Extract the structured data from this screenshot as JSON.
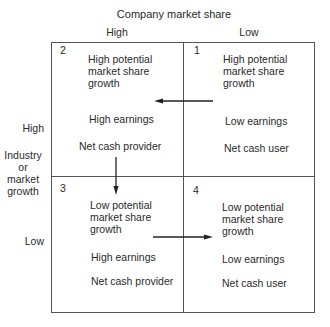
{
  "title": "Company market share",
  "columns": [
    {
      "label": "High"
    },
    {
      "label": "Low"
    }
  ],
  "rows": {
    "axis_label_lines": [
      "Industry",
      "or",
      "market",
      "growth"
    ],
    "high_label": "High",
    "low_label": "Low"
  },
  "quadrants": [
    {
      "number": "2",
      "position": "top-left",
      "potential": [
        "High potential",
        "market share",
        "growth"
      ],
      "earnings": "High earnings",
      "cash": "Net cash provider"
    },
    {
      "number": "1",
      "position": "top-right",
      "potential": [
        "High potential",
        "market share",
        "growth"
      ],
      "earnings": "Low earnings",
      "cash": "Net cash user"
    },
    {
      "number": "3",
      "position": "bottom-left",
      "potential": [
        "Low potential",
        "market share",
        "growth"
      ],
      "earnings": "High earnings",
      "cash": "Net cash provider"
    },
    {
      "number": "4",
      "position": "bottom-right",
      "potential": [
        "Low potential",
        "market share",
        "growth"
      ],
      "earnings": "Low earnings",
      "cash": "Net cash user"
    }
  ],
  "arrows": [
    {
      "from": "1",
      "to": "2",
      "direction": "left"
    },
    {
      "from": "2",
      "to": "3",
      "direction": "down"
    },
    {
      "from": "3",
      "to": "4",
      "direction": "right"
    }
  ],
  "colors": {
    "line": "#555555",
    "text": "#2a2a2a"
  }
}
